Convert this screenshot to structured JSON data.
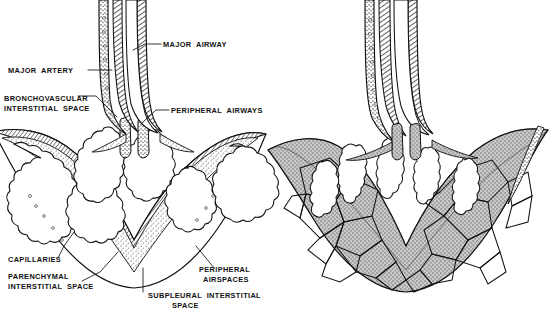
{
  "figure": {
    "panels": [
      {
        "id": "left",
        "name": "normal-lobule",
        "caption": ""
      },
      {
        "id": "right",
        "name": "edematous-lobule",
        "caption": ""
      }
    ]
  },
  "colors": {
    "ink": "#111111",
    "paper": "#ffffff",
    "stipple": "#8d8d8d",
    "tissue_fill": "#9a9a9a",
    "hatch": "#4a4a4a"
  },
  "labels": [
    {
      "id": "major-airway",
      "text": "MAJOR AIRWAY",
      "lines": [
        "MAJOR AIRWAY"
      ],
      "x": 163,
      "y": 47,
      "anchor": "start"
    },
    {
      "id": "major-artery",
      "text": "MAJOR ARTERY",
      "lines": [
        "MAJOR ARTERY"
      ],
      "x": 8,
      "y": 73,
      "anchor": "start"
    },
    {
      "id": "bronchovascular-interstitial-space",
      "text": "BRONCHOVASCULAR INTERSTITIAL SPACE",
      "lines": [
        "BRONCHOVASCULAR",
        "INTERSTITIAL SPACE"
      ],
      "x": 4,
      "y": 101,
      "anchor": "start"
    },
    {
      "id": "peripheral-airways",
      "text": "PERIPHERAL AIRWAYS",
      "lines": [
        "PERIPHERAL AIRWAYS"
      ],
      "x": 171,
      "y": 113,
      "anchor": "start"
    },
    {
      "id": "capillaries",
      "text": "CAPILLARIES",
      "lines": [
        "CAPILLARIES"
      ],
      "x": 8,
      "y": 262,
      "anchor": "start"
    },
    {
      "id": "parenchymal-interstitial-space",
      "text": "PARENCHYMAL INTERSTITIAL SPACE",
      "lines": [
        "PARENCHYMAL",
        "INTERSTITIAL SPACE"
      ],
      "x": 8,
      "y": 279,
      "anchor": "start"
    },
    {
      "id": "subpleural-interstitial-space",
      "text": "SUBPLEURAL INTERSTITIAL SPACE",
      "lines": [
        "SUBPLEURAL INTERSTITIAL",
        "SPACE"
      ],
      "x": 148,
      "y": 298,
      "anchor": "start"
    },
    {
      "id": "peripheral-airspaces",
      "text": "PERIPHERAL AIRSPACES",
      "lines": [
        "PERIPHERAL",
        "AIRSPACES"
      ],
      "x": 199,
      "y": 272,
      "anchor": "start"
    }
  ]
}
